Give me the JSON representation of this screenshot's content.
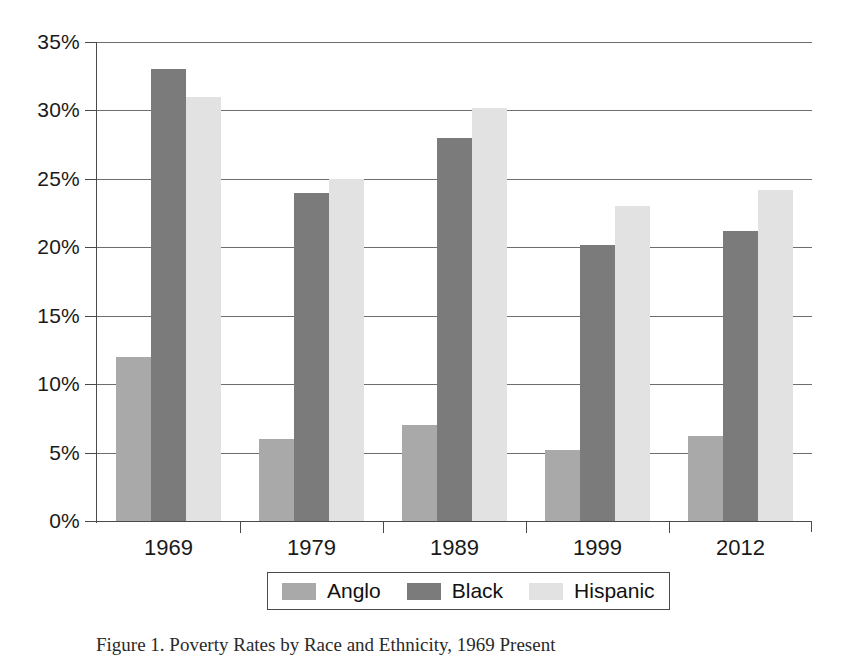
{
  "chart_data": {
    "type": "bar",
    "title": "",
    "xlabel": "",
    "ylabel": "",
    "categories": [
      "1969",
      "1979",
      "1989",
      "1999",
      "2012"
    ],
    "series": [
      {
        "name": "Anglo",
        "color": "#a9a9a9",
        "values": [
          12.0,
          6.0,
          7.0,
          5.2,
          6.2
        ]
      },
      {
        "name": "Black",
        "color": "#7b7b7b",
        "values": [
          33.0,
          24.0,
          28.0,
          20.2,
          21.2
        ]
      },
      {
        "name": "Hispanic",
        "color": "#e2e2e2",
        "values": [
          31.0,
          25.0,
          30.2,
          23.0,
          24.2
        ]
      }
    ],
    "ylim": [
      0,
      35
    ],
    "ytick_values": [
      0,
      5,
      10,
      15,
      20,
      25,
      30,
      35
    ],
    "ytick_labels": [
      "0%",
      "5%",
      "10%",
      "15%",
      "20%",
      "25%",
      "30%",
      "35%"
    ],
    "value_suffix": "%",
    "grid": true,
    "legend_position": "bottom-center",
    "legend_entries": [
      "Anglo",
      "Black",
      "Hispanic"
    ]
  },
  "caption": {
    "text": "Figure 1. Poverty Rates by Race and Ethnicity, 1969 Present"
  }
}
